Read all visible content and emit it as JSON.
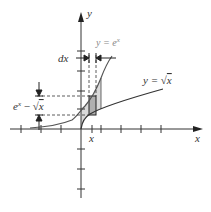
{
  "diagram": {
    "type": "area-between-curves",
    "axes": {
      "x_label": "x",
      "y_label": "y",
      "x_ticks": [
        -3,
        -2,
        -1,
        1,
        2,
        3,
        4
      ],
      "y_ticks": [
        4,
        3,
        2,
        1,
        -1,
        -2,
        -3
      ]
    },
    "curves": [
      {
        "name": "exp",
        "label": "y = e^x",
        "label_parts": [
          "y = e",
          "x"
        ],
        "color": "#555555"
      },
      {
        "name": "sqrt",
        "label": "y = √x",
        "label_parts": [
          "y = ",
          "√",
          "x"
        ],
        "color": "#333333"
      }
    ],
    "strip": {
      "x_label": "x",
      "width_label": "dx",
      "height_label": "e^x − √x",
      "height_label_parts": [
        "e",
        "x",
        " − ",
        "√",
        "x"
      ],
      "fill": "#b0b0b0"
    },
    "shaded_region_fill": "#d9d9d9"
  }
}
